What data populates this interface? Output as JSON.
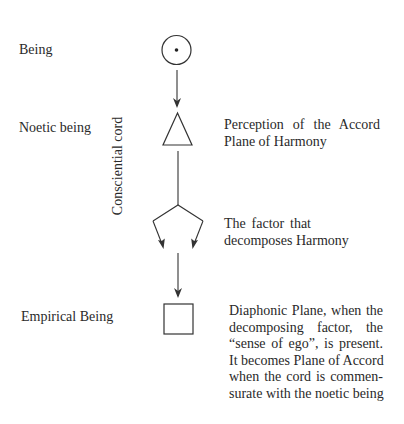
{
  "diagram": {
    "levels": [
      {
        "label": "Being",
        "shape": "circle-with-dot-icon",
        "description_lines": []
      },
      {
        "label": "Noetic being",
        "shape": "triangle-icon",
        "description_lines": [
          "Perception of the Accord",
          "Plane of Harmony"
        ]
      },
      {
        "label": "",
        "shape": "fork-arrows-icon",
        "description_lines": [
          "The factor that",
          "decomposes Harmony"
        ]
      },
      {
        "label": "Empirical Being",
        "shape": "square-icon",
        "description_lines": [
          "Diaphonic Plane, when the",
          "decomposing factor, the",
          "“sense of ego”, is present.",
          "It becomes Plane of Accord",
          "when the cord is commen-",
          "surate with the noetic being"
        ]
      }
    ],
    "side_label": "Consciential cord",
    "colors": {
      "stroke": "#333333",
      "text": "#2a2a2a",
      "background": "#ffffff"
    }
  }
}
